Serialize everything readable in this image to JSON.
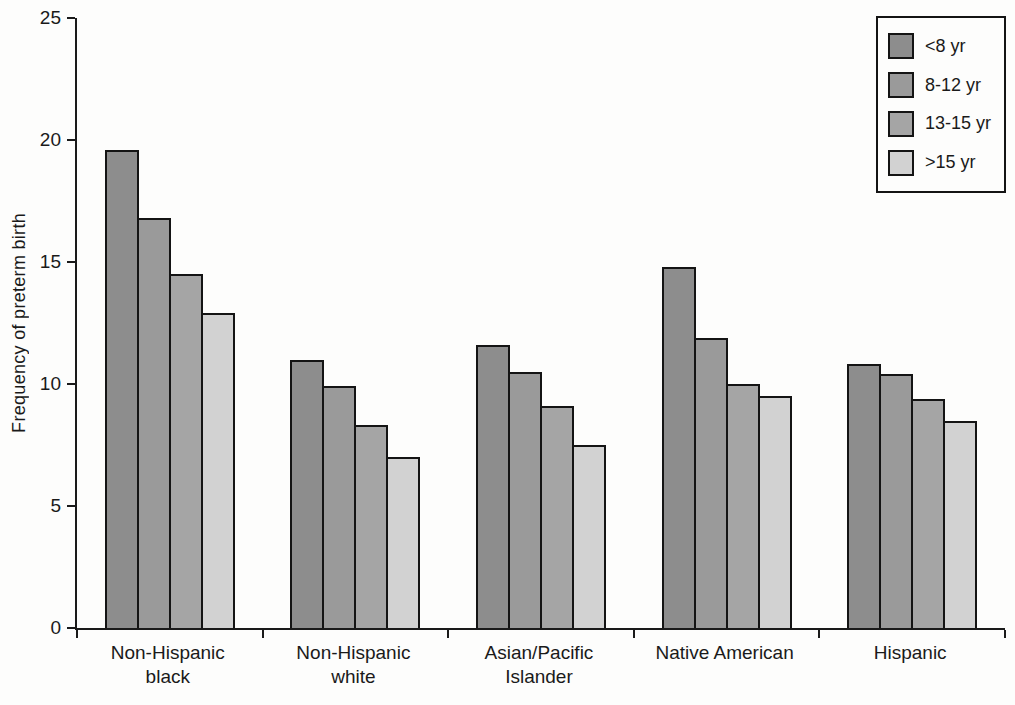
{
  "figure": {
    "background": "#fdfdfc",
    "axis_color": "#1a1a1a"
  },
  "chart_data": {
    "type": "bar",
    "ylabel": "Frequency of preterm birth",
    "xlabel": "",
    "ylim": [
      0,
      25
    ],
    "yticks": [
      0,
      5,
      10,
      15,
      20,
      25
    ],
    "grid": false,
    "legend_position": "top-right",
    "categories": [
      "Non-Hispanic\nblack",
      "Non-Hispanic\nwhite",
      "Asian/Pacific\nIslander",
      "Native American",
      "Hispanic"
    ],
    "series": [
      {
        "name": "<8 yr",
        "color": "#8d8d8d",
        "values": [
          19.6,
          11.0,
          11.6,
          14.8,
          10.8
        ]
      },
      {
        "name": "8-12 yr",
        "color": "#9a9a9a",
        "values": [
          16.8,
          9.9,
          10.5,
          11.9,
          10.4
        ]
      },
      {
        "name": "13-15 yr",
        "color": "#a5a5a5",
        "values": [
          14.5,
          8.3,
          9.1,
          10.0,
          9.4
        ]
      },
      {
        "name": ">15 yr",
        "color": "#d2d2d2",
        "values": [
          12.9,
          7.0,
          7.5,
          9.5,
          8.5
        ]
      }
    ]
  }
}
